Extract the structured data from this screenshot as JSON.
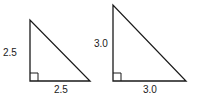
{
  "diagram": {
    "triangles": [
      {
        "id": "small",
        "vertical_label": "2.5",
        "horizontal_label": "2.5",
        "right_angle": true
      },
      {
        "id": "large",
        "vertical_label": "3.0",
        "horizontal_label": "3.0",
        "right_angle": true
      }
    ],
    "stroke_color": "#1a1a1a"
  }
}
